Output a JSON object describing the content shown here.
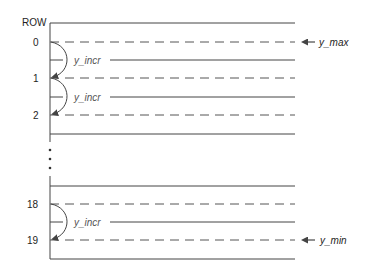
{
  "diagram": {
    "header_label": "ROW",
    "rows": [
      {
        "label": "0",
        "y": 42
      },
      {
        "label": "1",
        "y": 78
      },
      {
        "label": "2",
        "y": 115
      },
      {
        "label": "18",
        "y": 204
      },
      {
        "label": "19",
        "y": 240
      }
    ],
    "increment_label": "y_incr",
    "pointers": {
      "max": {
        "label": "y_max",
        "row": "0"
      },
      "min": {
        "label": "y_min",
        "row": "19"
      }
    },
    "ellipsis": "⋮",
    "colors": {
      "line": "#444444",
      "dashed": "#555555",
      "text": "#1e1e1e",
      "incr_text": "#555555"
    }
  }
}
